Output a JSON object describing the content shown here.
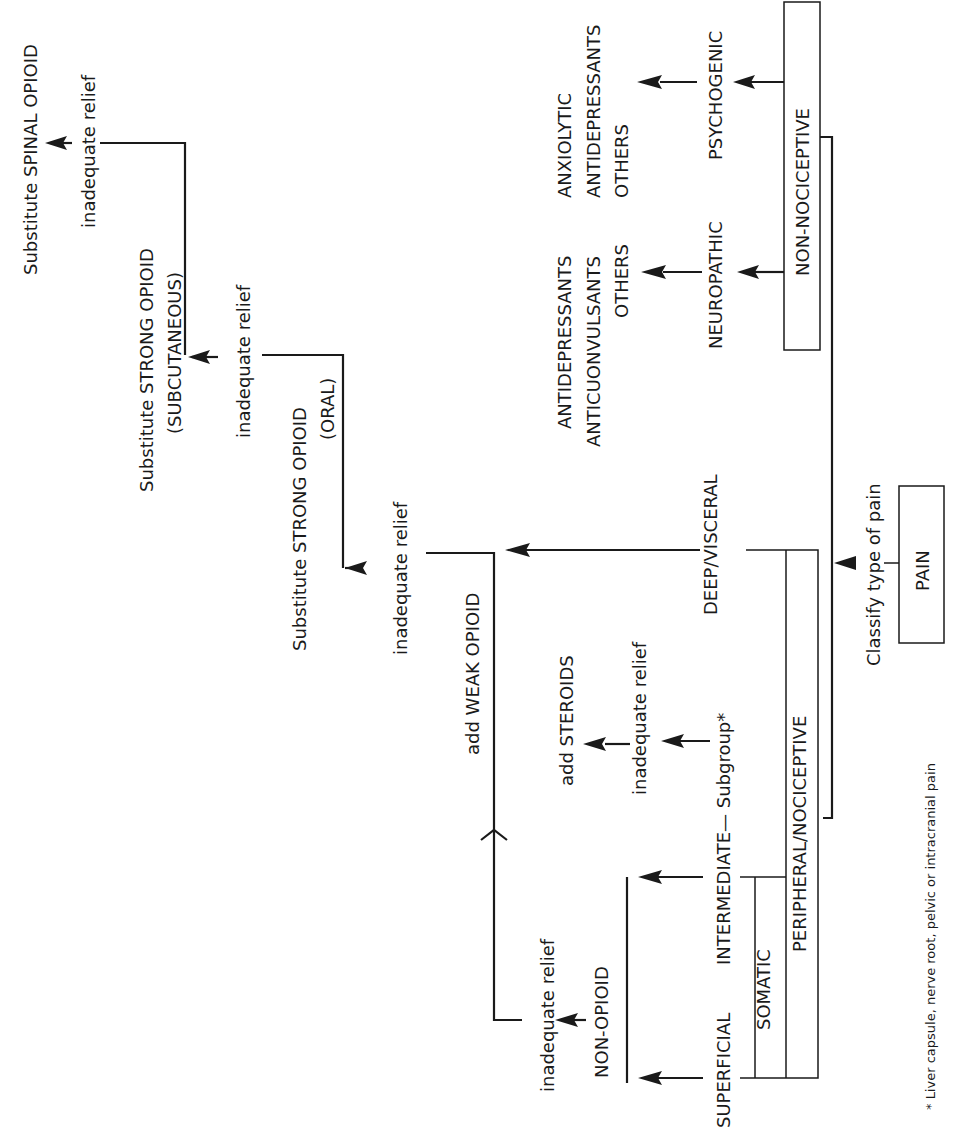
{
  "diagram": {
    "root": {
      "label": "PAIN"
    },
    "classify_label": "Classify type of pain",
    "branches": {
      "non_nociceptive": {
        "label": "NON-NOCICEPTIVE",
        "psychogenic": {
          "label": "PSYCHOGENIC",
          "treatments": [
            "ANXIOLYTIC",
            "ANTIDEPRESSANTS",
            "OTHERS"
          ]
        },
        "neuropathic": {
          "label": "NEUROPATHIC",
          "treatments": [
            "ANTIDEPRESSANTS",
            "ANTICUONVULSANTS",
            "OTHERS"
          ]
        }
      },
      "peripheral_nociceptive": {
        "label": "PERIPHERAL/NOCICEPTIVE",
        "deep_visceral": {
          "label": "DEEP/VISCERAL"
        },
        "somatic": {
          "label": "SOMATIC",
          "superficial": {
            "label": "SUPERFICIAL"
          },
          "intermediate": {
            "label": "INTERMEDIATE",
            "subgroup_label": "— Subgroup*"
          }
        }
      }
    },
    "steps": {
      "non_opioid": "NON-OPIOID",
      "add_steroids": "add STEROIDS",
      "add_weak_opioid": "add WEAK OPIOID",
      "strong_oral_line1": "Substitute STRONG OPIOID",
      "strong_oral_line2": "(ORAL)",
      "strong_subcut_line1": "Substitute STRONG OPIOID",
      "strong_subcut_line2": "(SUBCUTANEOUS)",
      "spinal": "Substitute SPINAL OPIOID"
    },
    "inadequate_relief": "inadequate relief",
    "footnote": "* Liver capsule, nerve root, pelvic or intracranial pain"
  }
}
